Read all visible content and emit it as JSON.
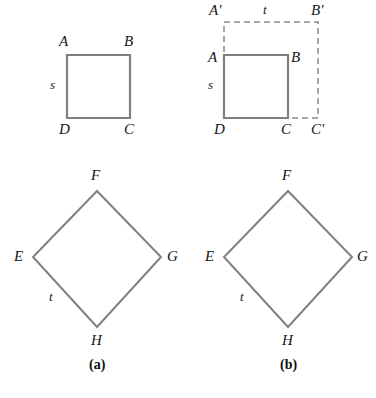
{
  "figure": {
    "stroke_color": "#808080",
    "dash_color": "#8a8a8a",
    "text_color": "#161616",
    "background": "#ffffff"
  },
  "panels": [
    {
      "id": "a",
      "caption": "(a)",
      "square": {
        "name": "square-abcd",
        "vertices": [
          {
            "label": "A",
            "x": 67,
            "y": 55,
            "label_x": 59,
            "label_y": 34
          },
          {
            "label": "B",
            "x": 130,
            "y": 55,
            "label_x": 124,
            "label_y": 34
          },
          {
            "label": "C",
            "x": 130,
            "y": 118,
            "label_x": 124,
            "label_y": 122
          },
          {
            "label": "D",
            "x": 67,
            "y": 118,
            "label_x": 59,
            "label_y": 122
          }
        ],
        "side_label": "s",
        "side_label_x": 50,
        "side_label_y": 78
      },
      "rhombus": {
        "name": "rhombus-efgh",
        "vertices": [
          {
            "label": "F",
            "x": 97,
            "y": 191,
            "label_x": 91,
            "label_y": 168
          },
          {
            "label": "G",
            "x": 161,
            "y": 257,
            "label_x": 167,
            "label_y": 249
          },
          {
            "label": "H",
            "x": 97,
            "y": 327,
            "label_x": 91,
            "label_y": 333
          },
          {
            "label": "E",
            "x": 33,
            "y": 257,
            "label_x": 14,
            "label_y": 249
          }
        ],
        "side_label": "t",
        "side_label_x": 49,
        "side_label_y": 290
      }
    },
    {
      "id": "b",
      "caption": "(b)",
      "square": {
        "name": "square-abcd",
        "vertices": [
          {
            "label": "A",
            "x": 224,
            "y": 55,
            "label_x": 208,
            "label_y": 50
          },
          {
            "label": "B",
            "x": 288,
            "y": 55,
            "label_x": 291,
            "label_y": 50
          },
          {
            "label": "C",
            "x": 288,
            "y": 118,
            "label_x": 281,
            "label_y": 122
          },
          {
            "label": "D",
            "x": 224,
            "y": 118,
            "label_x": 214,
            "label_y": 122
          }
        ],
        "side_label": "s",
        "side_label_x": 208,
        "side_label_y": 78
      },
      "dashed_rect": {
        "name": "dashed-rectangle-a-prime-b-prime-c-prime-d",
        "x1": 224,
        "y1": 22,
        "x2": 318,
        "y2": 118,
        "vertices": [
          {
            "label": "A′",
            "label_x": 209,
            "label_y": 3
          },
          {
            "label": "B′",
            "label_x": 311,
            "label_y": 3
          },
          {
            "label": "C′",
            "label_x": 311,
            "label_y": 122
          }
        ],
        "side_label": "t",
        "side_label_x": 263,
        "side_label_y": 3
      },
      "rhombus": {
        "name": "rhombus-efgh",
        "vertices": [
          {
            "label": "F",
            "x": 288,
            "y": 191,
            "label_x": 282,
            "label_y": 168
          },
          {
            "label": "G",
            "x": 352,
            "y": 257,
            "label_x": 357,
            "label_y": 249
          },
          {
            "label": "H",
            "x": 288,
            "y": 327,
            "label_x": 282,
            "label_y": 333
          },
          {
            "label": "E",
            "x": 224,
            "y": 257,
            "label_x": 205,
            "label_y": 249
          }
        ],
        "side_label": "t",
        "side_label_x": 240,
        "side_label_y": 290
      }
    }
  ],
  "captions": {
    "a": {
      "text": "(a)",
      "x": 89,
      "y": 358
    },
    "b": {
      "text": "(b)",
      "x": 280,
      "y": 358
    }
  }
}
